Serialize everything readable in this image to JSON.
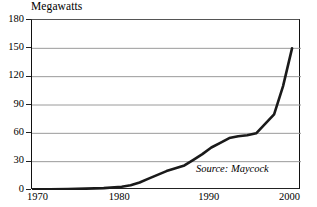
{
  "chart_data": {
    "type": "line",
    "title": "",
    "ylabel": "Megawatts",
    "xlabel": "",
    "xlim": [
      1970,
      2000
    ],
    "ylim": [
      0,
      180
    ],
    "grid": true,
    "legend": null,
    "y_ticks": [
      180,
      150,
      120,
      90,
      60,
      30,
      0
    ],
    "y_tick_labels": [
      "180",
      "150",
      "120",
      "90",
      "60",
      "30",
      "0"
    ],
    "x_ticks": [
      1970,
      1980,
      1990,
      2000
    ],
    "x_tick_labels": [
      "1970",
      "1980",
      "1990",
      "2000"
    ],
    "annotations": [
      {
        "name": "source-note",
        "text": "Source: Maycock",
        "style": "italic",
        "x": 1996,
        "y": 18
      }
    ],
    "series": [
      {
        "name": "World photovoltaic shipments",
        "color": "#1a1a1a",
        "x": [
          1970,
          1972,
          1974,
          1976,
          1978,
          1980,
          1981,
          1982,
          1983,
          1984,
          1985,
          1986,
          1987,
          1988,
          1989,
          1990,
          1991,
          1992,
          1993,
          1994,
          1995,
          1996,
          1997,
          1998,
          1999
        ],
        "y": [
          0.5,
          0.7,
          1,
          1.5,
          2,
          3.5,
          5,
          8,
          12,
          16,
          20,
          23,
          26,
          32,
          38,
          45,
          50,
          55,
          57,
          58,
          60,
          70,
          80,
          110,
          150
        ]
      }
    ]
  },
  "labels": {
    "y_unit": "Megawatts"
  }
}
